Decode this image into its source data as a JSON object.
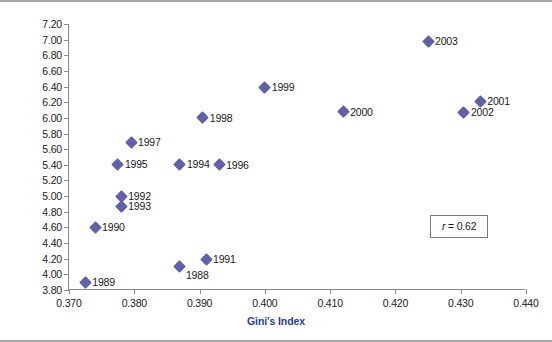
{
  "chart_data": {
    "type": "scatter",
    "title": "",
    "xlabel": "Gini's Index",
    "ylabel": "Homicides per 100,000 Inhabitants Rate",
    "xlim": [
      0.37,
      0.44
    ],
    "ylim": [
      3.8,
      7.2
    ],
    "xticks": [
      "0.370",
      "0.380",
      "0.390",
      "0.400",
      "0.410",
      "0.420",
      "0.430",
      "0.440"
    ],
    "xtick_values": [
      0.37,
      0.38,
      0.39,
      0.4,
      0.41,
      0.42,
      0.43,
      0.44
    ],
    "yticks": [
      "3.80",
      "4.00",
      "4.20",
      "4.40",
      "4.60",
      "4.80",
      "5.00",
      "5.20",
      "5.40",
      "5.60",
      "5.80",
      "6.00",
      "6.20",
      "6.40",
      "6.60",
      "6.80",
      "7.00",
      "7.20"
    ],
    "ytick_values": [
      3.8,
      4.0,
      4.2,
      4.4,
      4.6,
      4.8,
      5.0,
      5.2,
      5.4,
      5.6,
      5.8,
      6.0,
      6.2,
      6.4,
      6.6,
      6.8,
      7.0,
      7.2
    ],
    "grid": false,
    "legend": false,
    "marker_color": "#6161a8",
    "axis_title_color": "#2b3b9e",
    "points": [
      {
        "label": "1988",
        "x": 0.387,
        "y": 4.1,
        "label_side": "below-right"
      },
      {
        "label": "1989",
        "x": 0.3725,
        "y": 3.9,
        "label_side": "right"
      },
      {
        "label": "1990",
        "x": 0.374,
        "y": 4.6,
        "label_side": "right"
      },
      {
        "label": "1991",
        "x": 0.391,
        "y": 4.19,
        "label_side": "right"
      },
      {
        "label": "1992",
        "x": 0.378,
        "y": 5.0,
        "label_side": "right"
      },
      {
        "label": "1993",
        "x": 0.378,
        "y": 4.87,
        "label_side": "right"
      },
      {
        "label": "1994",
        "x": 0.387,
        "y": 5.41,
        "label_side": "right"
      },
      {
        "label": "1995",
        "x": 0.3775,
        "y": 5.41,
        "label_side": "right"
      },
      {
        "label": "1996",
        "x": 0.393,
        "y": 5.4,
        "label_side": "right"
      },
      {
        "label": "1997",
        "x": 0.3795,
        "y": 5.69,
        "label_side": "right"
      },
      {
        "label": "1998",
        "x": 0.3905,
        "y": 6.0,
        "label_side": "right"
      },
      {
        "label": "1999",
        "x": 0.4,
        "y": 6.39,
        "label_side": "right"
      },
      {
        "label": "2000",
        "x": 0.412,
        "y": 6.08,
        "label_side": "right"
      },
      {
        "label": "2001",
        "x": 0.433,
        "y": 6.21,
        "label_side": "right"
      },
      {
        "label": "2002",
        "x": 0.4305,
        "y": 6.07,
        "label_side": "right"
      },
      {
        "label": "2003",
        "x": 0.425,
        "y": 6.98,
        "label_side": "right"
      }
    ],
    "annotations": [
      {
        "name": "correlation",
        "symbol": "r",
        "text": " = 0.62",
        "full_text": "r = 0.62"
      }
    ]
  }
}
